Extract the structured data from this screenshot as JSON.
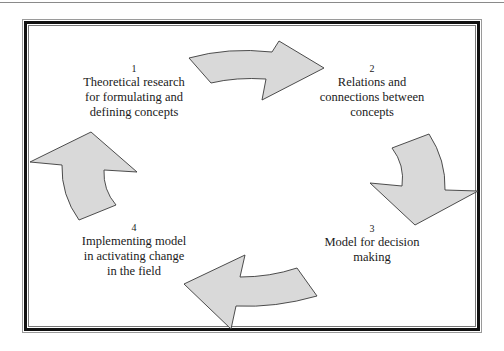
{
  "diagram": {
    "type": "cycle",
    "fill_color": "#d9d9d9",
    "stroke_color": "#3a3a3a",
    "frame_color": "#111111",
    "steps": [
      {
        "number": "1",
        "lines": [
          "Theoretical research",
          "for formulating and",
          "defining concepts"
        ]
      },
      {
        "number": "2",
        "lines": [
          "Relations and",
          "connections between",
          "concepts"
        ]
      },
      {
        "number": "3",
        "lines": [
          "Model for decision",
          "making"
        ]
      },
      {
        "number": "4",
        "lines": [
          "Implementing model",
          "in activating change",
          "in the field"
        ]
      }
    ],
    "arrows": [
      {
        "from": "1",
        "to": "2",
        "direction": "right"
      },
      {
        "from": "2",
        "to": "3",
        "direction": "down"
      },
      {
        "from": "3",
        "to": "4",
        "direction": "left"
      },
      {
        "from": "4",
        "to": "1",
        "direction": "up"
      }
    ]
  }
}
